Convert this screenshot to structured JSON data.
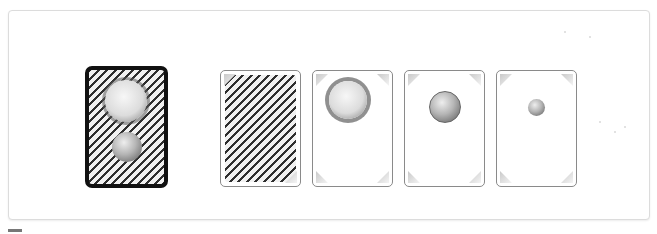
{
  "game": {
    "title": "",
    "board": {
      "selected_card": {
        "name": "deck-back",
        "pattern": "diagonal-stripes",
        "icons": [
          "sun-icon",
          "planet-icon"
        ],
        "selected": true
      },
      "cards": [
        {
          "name": "card-back",
          "pattern": "diagonal-stripes",
          "icon": null
        },
        {
          "name": "sun-card",
          "pattern": "blank",
          "icon": "sun-icon",
          "icon_size": "large"
        },
        {
          "name": "planet-card",
          "pattern": "blank",
          "icon": "planet-icon",
          "icon_size": "medium"
        },
        {
          "name": "moon-card",
          "pattern": "blank",
          "icon": "moon-icon",
          "icon_size": "small"
        }
      ]
    },
    "colors": {
      "selected_border": "#111111",
      "card_border": "#8a8a8a",
      "board_border": "#dcdcdc",
      "stripe": "#2e2e2e"
    }
  }
}
